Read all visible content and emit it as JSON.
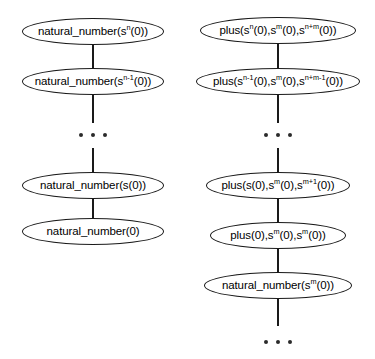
{
  "diagram": {
    "type": "derivation-chains",
    "background_color": "#ffffff",
    "stroke_color": "#1a1a1a",
    "text_color": "#000000",
    "columns": [
      {
        "id": "natural-number-chain",
        "name": "natural_number chain",
        "nodes": [
          {
            "id": "nn-sn",
            "base": "natural_number(s",
            "sup": "n",
            "tail": "(0))"
          },
          {
            "id": "nn-sn1",
            "base": "natural_number(s",
            "sup": "n-1",
            "tail": "(0))"
          },
          {
            "id": "nn-s1",
            "base": "natural_number(s(0))",
            "sup": "",
            "tail": ""
          },
          {
            "id": "nn-zero",
            "base": "natural_number(0)",
            "sup": "",
            "tail": ""
          }
        ],
        "ellipsis_after_index": 1,
        "trailing_ellipsis": false
      },
      {
        "id": "plus-chain",
        "name": "plus chain",
        "nodes": [
          {
            "id": "plus-n",
            "parts": [
              {
                "t": "plus(s"
              },
              {
                "s": "n"
              },
              {
                "t": "(0),s"
              },
              {
                "s": "m"
              },
              {
                "t": "(0),s"
              },
              {
                "s": "n+m"
              },
              {
                "t": "(0))"
              }
            ]
          },
          {
            "id": "plus-n1",
            "parts": [
              {
                "t": "plus(s"
              },
              {
                "s": "n-1"
              },
              {
                "t": "(0),s"
              },
              {
                "s": "m"
              },
              {
                "t": "(0),s"
              },
              {
                "s": "n+m-1"
              },
              {
                "t": "(0))"
              }
            ]
          },
          {
            "id": "plus-1",
            "parts": [
              {
                "t": "plus(s(0),s"
              },
              {
                "s": "m"
              },
              {
                "t": "(0),s"
              },
              {
                "s": "m+1"
              },
              {
                "t": "(0))"
              }
            ]
          },
          {
            "id": "plus-0",
            "parts": [
              {
                "t": "plus(0),s"
              },
              {
                "s": "m"
              },
              {
                "t": "(0),s"
              },
              {
                "s": "m"
              },
              {
                "t": "(0))"
              }
            ]
          },
          {
            "id": "nn-sm",
            "parts": [
              {
                "t": "natural_number(s"
              },
              {
                "s": "m"
              },
              {
                "t": "(0))"
              }
            ]
          }
        ],
        "ellipsis_after_index": 1,
        "trailing_ellipsis": true
      }
    ],
    "ellipsis_glyph": "..."
  }
}
